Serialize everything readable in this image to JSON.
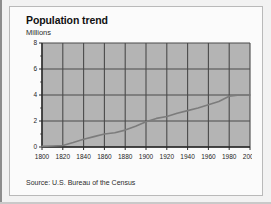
{
  "figure": {
    "title": "Population trend",
    "unit_label": "Millions",
    "source": "Source: U.S. Bureau of the Census"
  },
  "colors": {
    "plot_background": "#b4b4b4",
    "gridline": "#4a4a4a",
    "axis": "#2a2a2a",
    "series_line": "#7c7c7c",
    "card_background": "#fbfbfb",
    "page_background": "#f2f2f2",
    "text": "#1c1c1c"
  },
  "chart_data": {
    "type": "line",
    "title": "Population trend",
    "xlabel": "",
    "ylabel": "Millions",
    "xlim": [
      1800,
      2000
    ],
    "ylim": [
      0,
      8
    ],
    "grid": true,
    "legend": false,
    "xticks": [
      1800,
      1820,
      1840,
      1860,
      1880,
      1900,
      1920,
      1940,
      1960,
      1980,
      2000
    ],
    "yticks": [
      0,
      2,
      4,
      6,
      8
    ],
    "x_tick_labels": [
      "1800",
      "1820",
      "1840",
      "1860",
      "1880",
      "1900",
      "1920",
      "1940",
      "1960",
      "1980",
      "2000"
    ],
    "y_tick_labels": [
      "0",
      "2",
      "4",
      "6",
      "8"
    ],
    "series": [
      {
        "name": "Population",
        "x": [
          1800,
          1810,
          1820,
          1830,
          1840,
          1850,
          1860,
          1870,
          1880,
          1890,
          1900,
          1910,
          1920,
          1930,
          1940,
          1950,
          1960,
          1970,
          1980,
          1990,
          2000
        ],
        "values": [
          0.05,
          0.08,
          0.12,
          0.35,
          0.6,
          0.8,
          1.0,
          1.1,
          1.3,
          1.6,
          1.95,
          2.2,
          2.35,
          2.6,
          2.8,
          3.0,
          3.25,
          3.5,
          3.9,
          4.0,
          4.0
        ]
      }
    ]
  }
}
